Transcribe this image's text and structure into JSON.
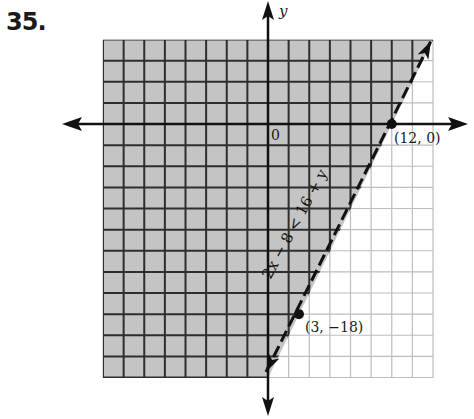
{
  "problem": {
    "number_label": "35."
  },
  "chart_data": {
    "type": "line",
    "title": "",
    "subtitle": "",
    "xlabel": "",
    "ylabel": "y",
    "origin_label": "0",
    "grid": true,
    "grid_cell_units": 2,
    "xlim": [
      -16,
      16
    ],
    "ylim": [
      -24,
      8
    ],
    "inequality": "2x − 8 < 16 + y",
    "boundary_line": {
      "equation": "y = 2x − 24",
      "style": "dashed",
      "slope": 2,
      "y_intercept": -24
    },
    "shaded_region": "left of / above the line (y > 2x − 24)",
    "points": [
      {
        "x": 12,
        "y": 0,
        "label": "(12, 0)"
      },
      {
        "x": 3,
        "y": -18,
        "label": "(3, −18)"
      }
    ],
    "legend": null
  },
  "colors": {
    "shade": "#c4c4c4",
    "grid_dark": "#2e2e2e",
    "grid_light": "#bdbdbd",
    "ink": "#111111",
    "background": "#ffffff"
  }
}
